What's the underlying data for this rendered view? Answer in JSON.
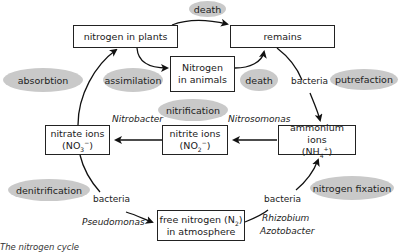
{
  "diagram": {
    "title": "The nitrogen cycle",
    "nodes": {
      "plants": {
        "line1": "nitrogen in plants"
      },
      "remains": {
        "line1": "remains"
      },
      "animals": {
        "line1": "Nitrogen",
        "line2": "in animals"
      },
      "nitrate": {
        "line1": "nitrate ions",
        "line2_pre": "(NO",
        "line2_sub": "3",
        "line2_sup": "−",
        "line2_post": ")"
      },
      "nitrite": {
        "line1": "nitrite ions",
        "line2_pre": "(NO",
        "line2_sub": "2",
        "line2_sup": "−",
        "line2_post": ")"
      },
      "ammonium": {
        "line1": "ammonium ions",
        "line2_pre": "(NH",
        "line2_sub": "4",
        "line2_sup": "+",
        "line2_post": ")"
      },
      "free_nitrogen": {
        "line1_pre": "free nitrogen (N",
        "line1_sub": "2",
        "line1_post": ")",
        "line2": "in atmosphere"
      }
    },
    "processes": {
      "death_top": "death",
      "absorbtion": "absorbtion",
      "assimilation": "assimilation",
      "death_mid": "death",
      "putrefaction": "putrefaction",
      "nitrification": "nitrification",
      "denitrification": "denitrification",
      "nitrogen_fixation": "nitrogen fixation"
    },
    "labels": {
      "bacteria_putrefaction": "bacteria",
      "nitrobacter": "Nitrobacter",
      "nitrosomonas": "Nitrosomonas",
      "bacteria_denitrification": "bacteria",
      "pseudomonas": "Pseudomonas",
      "bacteria_fixation": "bacteria",
      "rhizobium": "Rhizobium",
      "azotobacter": "Azotobacter"
    },
    "colors": {
      "oval_fill": "#c9c9c9",
      "box_border": "#222222",
      "arrow": "#111111"
    }
  }
}
